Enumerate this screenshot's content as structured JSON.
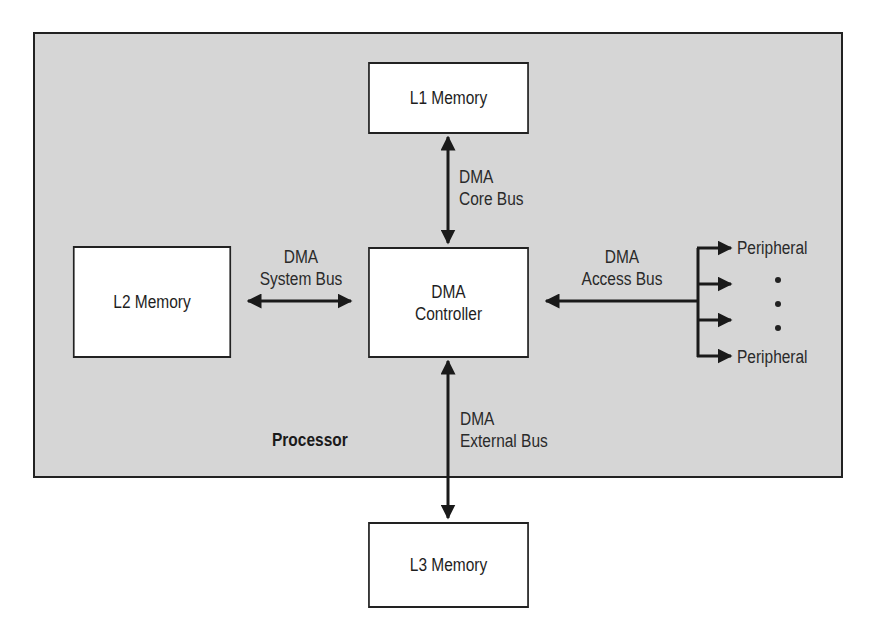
{
  "diagram": {
    "processor": {
      "label": "Processor"
    },
    "nodes": {
      "l1": {
        "label": "L1 Memory"
      },
      "l2": {
        "label": "L2 Memory"
      },
      "l3": {
        "label": "L3 Memory"
      },
      "dma": {
        "line1": "DMA",
        "line2": "Controller"
      },
      "peripheral_top": {
        "label": "Peripheral"
      },
      "peripheral_bottom": {
        "label": "Peripheral"
      }
    },
    "buses": {
      "core": {
        "line1": "DMA",
        "line2": "Core Bus"
      },
      "system": {
        "line1": "DMA",
        "line2": "System Bus"
      },
      "access": {
        "line1": "DMA",
        "line2": "Access Bus"
      },
      "external": {
        "line1": "DMA",
        "line2": "External Bus"
      }
    },
    "edges": [
      {
        "from": "L1 Memory",
        "to": "DMA Controller",
        "bus": "DMA Core Bus",
        "direction": "bidirectional"
      },
      {
        "from": "L2 Memory",
        "to": "DMA Controller",
        "bus": "DMA System Bus",
        "direction": "bidirectional"
      },
      {
        "from": "Peripherals",
        "to": "DMA Controller",
        "bus": "DMA Access Bus",
        "direction": "to DMA Controller; branches to 4 peripheral arrows"
      },
      {
        "from": "DMA Controller",
        "to": "L3 Memory",
        "bus": "DMA External Bus",
        "direction": "bidirectional"
      }
    ],
    "ellipsis_dots": 3,
    "colors": {
      "processor_fill": "#d6d6d6",
      "box_fill": "#ffffff",
      "stroke": "#222222"
    }
  }
}
